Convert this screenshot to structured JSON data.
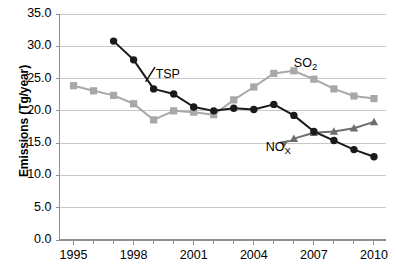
{
  "chart_data": {
    "type": "line",
    "title": "",
    "xlabel": "",
    "ylabel": "Emissions (Tg/year)",
    "xlim": [
      1994.3,
      2010.6
    ],
    "ylim": [
      0.0,
      35.0
    ],
    "grid": true,
    "legend": "inline-annotations",
    "yticks": [
      "0.0",
      "5.0",
      "10.0",
      "15.0",
      "20.0",
      "25.0",
      "30.0",
      "35.0"
    ],
    "ytick_values": [
      0.0,
      5.0,
      10.0,
      15.0,
      20.0,
      25.0,
      30.0,
      35.0
    ],
    "xticks": [
      "1995",
      "1998",
      "2001",
      "2004",
      "2007",
      "2010"
    ],
    "xtick_values": [
      1995,
      1998,
      2001,
      2004,
      2007,
      2010
    ],
    "x_minor_interval": 1,
    "series": [
      {
        "name": "TSP",
        "label": "TSP",
        "marker": "circle",
        "color": "#1a1a1a",
        "x": [
          1997,
          1998,
          1999,
          2000,
          2001,
          2002,
          2003,
          2004,
          2005,
          2006,
          2007,
          2008,
          2009,
          2010
        ],
        "values": [
          30.8,
          27.9,
          23.4,
          22.6,
          20.6,
          20.0,
          20.4,
          20.2,
          21.0,
          19.3,
          16.8,
          15.4,
          14.0,
          12.9
        ]
      },
      {
        "name": "SO2",
        "label": "SO",
        "label_sub": "2",
        "marker": "square",
        "color": "#a8a8a8",
        "x": [
          1995,
          1996,
          1997,
          1998,
          1999,
          2000,
          2001,
          2002,
          2003,
          2004,
          2005,
          2006,
          2007,
          2008,
          2009,
          2010
        ],
        "values": [
          23.9,
          23.1,
          22.4,
          21.1,
          18.6,
          20.0,
          19.8,
          19.4,
          21.7,
          23.7,
          25.8,
          26.2,
          24.9,
          23.4,
          22.3,
          21.9
        ]
      },
      {
        "name": "NOx",
        "label": "NO",
        "label_sub": "X",
        "marker": "triangle",
        "color": "#6e6e6e",
        "x": [
          2006,
          2007,
          2008,
          2009,
          2010
        ],
        "values": [
          15.7,
          16.6,
          16.8,
          17.3,
          18.3
        ]
      }
    ],
    "annotations": [
      {
        "text": "TSP",
        "x": 1999.1,
        "y": 25.6
      },
      {
        "text": "SO2",
        "x": 2006.0,
        "y": 27.2
      },
      {
        "text": "NOx",
        "x": 2004.6,
        "y": 14.3
      }
    ],
    "colors": {
      "tsp": "#1a1a1a",
      "so2": "#a8a8a8",
      "nox": "#6e6e6e",
      "grid": "#c8c8c8",
      "axis": "#909090",
      "background": "#ffffff"
    }
  }
}
